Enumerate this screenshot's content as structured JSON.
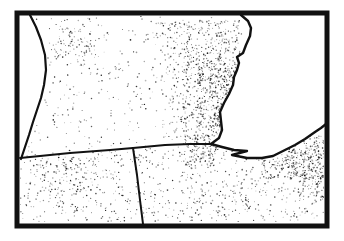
{
  "figure": {
    "kind": "dot-density-map",
    "background_color": "#ffffff",
    "ink_color": "#111111",
    "width": 344,
    "height": 241
  },
  "map": {
    "frame": {
      "x": 17,
      "y": 13,
      "w": 310,
      "h": 213,
      "stroke_width": 5
    },
    "clip": {
      "x": 20,
      "y": 16,
      "w": 304,
      "h": 206
    },
    "water_bodies": [
      {
        "name": "water-west-crescent",
        "polygon": [
          [
            19,
            15
          ],
          [
            30,
            15
          ],
          [
            36,
            27
          ],
          [
            41,
            40
          ],
          [
            45,
            55
          ],
          [
            46,
            70
          ],
          [
            44,
            85
          ],
          [
            41,
            98
          ],
          [
            37,
            110
          ],
          [
            33,
            122
          ],
          [
            29,
            135
          ],
          [
            25,
            147
          ],
          [
            21,
            159
          ],
          [
            19,
            159
          ]
        ],
        "shoreline": [
          [
            30,
            15
          ],
          [
            36,
            27
          ],
          [
            41,
            40
          ],
          [
            45,
            55
          ],
          [
            46,
            70
          ],
          [
            44,
            85
          ],
          [
            41,
            98
          ],
          [
            37,
            110
          ],
          [
            33,
            122
          ],
          [
            29,
            135
          ],
          [
            25,
            147
          ],
          [
            21,
            159
          ]
        ],
        "shore_width": 2.2
      },
      {
        "name": "lake-east",
        "polygon": [
          [
            241,
            15
          ],
          [
            248,
            21
          ],
          [
            251,
            28
          ],
          [
            250,
            36
          ],
          [
            246,
            45
          ],
          [
            243,
            53
          ],
          [
            237,
            57
          ],
          [
            239,
            63
          ],
          [
            237,
            70
          ],
          [
            234,
            77
          ],
          [
            233,
            85
          ],
          [
            229,
            94
          ],
          [
            224,
            103
          ],
          [
            220,
            112
          ],
          [
            221,
            121
          ],
          [
            222,
            130
          ],
          [
            219,
            138
          ],
          [
            211,
            144
          ],
          [
            222,
            147
          ],
          [
            234,
            150
          ],
          [
            247,
            151
          ],
          [
            232,
            155
          ],
          [
            247,
            158
          ],
          [
            262,
            158
          ],
          [
            273,
            156
          ],
          [
            285,
            150
          ],
          [
            295,
            145
          ],
          [
            305,
            139
          ],
          [
            315,
            132
          ],
          [
            321,
            128
          ],
          [
            326,
            124
          ],
          [
            326,
            15
          ]
        ],
        "shoreline": [
          [
            241,
            15
          ],
          [
            248,
            21
          ],
          [
            251,
            28
          ],
          [
            250,
            36
          ],
          [
            246,
            45
          ],
          [
            243,
            53
          ],
          [
            237,
            57
          ],
          [
            239,
            63
          ],
          [
            237,
            70
          ],
          [
            234,
            77
          ],
          [
            233,
            85
          ],
          [
            229,
            94
          ],
          [
            224,
            103
          ],
          [
            220,
            112
          ],
          [
            221,
            121
          ],
          [
            222,
            130
          ],
          [
            219,
            138
          ],
          [
            211,
            144
          ],
          [
            222,
            147
          ],
          [
            234,
            150
          ],
          [
            247,
            151
          ],
          [
            232,
            155
          ],
          [
            247,
            158
          ],
          [
            262,
            158
          ],
          [
            273,
            156
          ],
          [
            285,
            150
          ],
          [
            295,
            145
          ],
          [
            305,
            139
          ],
          [
            315,
            132
          ],
          [
            321,
            128
          ],
          [
            326,
            124
          ]
        ],
        "shore_width": 2.4
      }
    ],
    "boundary_lines": [
      {
        "name": "boundary-west-horizontal",
        "points": [
          [
            20,
            158
          ],
          [
            70,
            153
          ],
          [
            110,
            150
          ],
          [
            133,
            148
          ]
        ],
        "width": 2
      },
      {
        "name": "boundary-vertical",
        "points": [
          [
            133,
            148
          ],
          [
            137,
            175
          ],
          [
            140,
            200
          ],
          [
            143,
            224
          ]
        ],
        "width": 2
      },
      {
        "name": "boundary-east-horizontal",
        "points": [
          [
            133,
            148
          ],
          [
            165,
            145
          ],
          [
            190,
            144
          ],
          [
            211,
            144
          ]
        ],
        "width": 2
      }
    ],
    "stipple": {
      "seed": 1337,
      "dot": {
        "r_min": 0.4,
        "r_max": 0.85,
        "opacity_min": 0.3,
        "opacity_max": 0.95
      },
      "regions": [
        {
          "name": "northwest-general",
          "x": 20,
          "y": 16,
          "w": 221,
          "h": 133,
          "count": 420
        },
        {
          "name": "northwest-cluster",
          "x": 52,
          "y": 26,
          "w": 44,
          "h": 36,
          "count": 75
        },
        {
          "name": "coast-fringe",
          "x": 160,
          "y": 22,
          "w": 30,
          "h": 118,
          "count": 130
        },
        {
          "name": "coast-band",
          "x": 182,
          "y": 20,
          "w": 60,
          "h": 122,
          "count": 520
        },
        {
          "name": "coast-core",
          "x": 197,
          "y": 58,
          "w": 45,
          "h": 70,
          "count": 330
        },
        {
          "name": "southwest-county",
          "x": 20,
          "y": 150,
          "w": 121,
          "h": 73,
          "count": 300
        },
        {
          "name": "southwest-cluster",
          "x": 40,
          "y": 158,
          "w": 58,
          "h": 34,
          "count": 90
        },
        {
          "name": "south-mid-county",
          "x": 141,
          "y": 146,
          "w": 70,
          "h": 77,
          "count": 190
        },
        {
          "name": "southeast-land",
          "x": 209,
          "y": 148,
          "w": 115,
          "h": 75,
          "count": 320
        },
        {
          "name": "shore-junction-cluster",
          "x": 183,
          "y": 134,
          "w": 34,
          "h": 32,
          "count": 125
        },
        {
          "name": "east-edge-wedge",
          "x": 288,
          "y": 136,
          "w": 36,
          "h": 42,
          "count": 230
        },
        {
          "name": "south-shore-cluster",
          "x": 262,
          "y": 153,
          "w": 34,
          "h": 26,
          "count": 85
        },
        {
          "name": "east-edge-fade",
          "x": 298,
          "y": 176,
          "w": 26,
          "h": 22,
          "count": 55
        }
      ]
    }
  }
}
